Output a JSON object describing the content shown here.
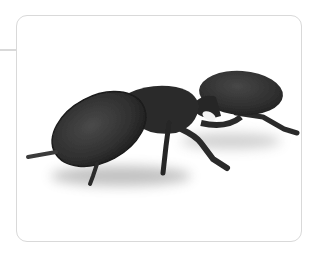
{
  "image": {
    "subject": "turtle ant with disc-shaped head",
    "alt": "Black ant with a large flattened disc-shaped head, photographed on white background"
  },
  "colors": {
    "frame_border": "#d9d9d9",
    "background": "#ffffff",
    "ant_body": "#2a2a2a",
    "ant_highlight": "#4a4a4a"
  }
}
